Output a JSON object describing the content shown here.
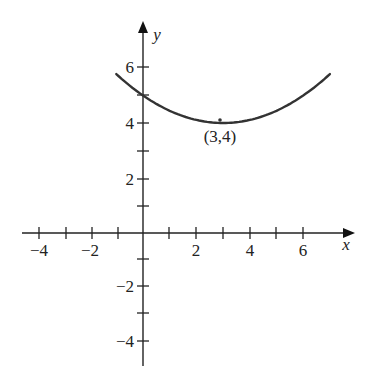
{
  "chart_data": {
    "type": "line",
    "title": "",
    "xlabel": "x",
    "ylabel": "y",
    "xlim": [
      -4.5,
      7.8
    ],
    "ylim": [
      -4.8,
      7.5
    ],
    "grid": false,
    "legend": null,
    "x_ticks": [
      -4,
      -3,
      -2,
      -1,
      1,
      2,
      3,
      4,
      5,
      6
    ],
    "x_tick_labels": [
      {
        "value": -4,
        "label": "−4"
      },
      {
        "value": -2,
        "label": "−2"
      },
      {
        "value": 2,
        "label": "2"
      },
      {
        "value": 4,
        "label": "4"
      },
      {
        "value": 6,
        "label": "6"
      }
    ],
    "y_ticks": [
      -4,
      -3,
      -2,
      -1,
      1,
      2,
      3,
      4,
      5,
      6
    ],
    "y_tick_labels": [
      {
        "value": 6,
        "label": "6"
      },
      {
        "value": 4,
        "label": "4"
      },
      {
        "value": 2,
        "label": "2"
      },
      {
        "value": -2,
        "label": "−2"
      },
      {
        "value": -4,
        "label": "−4"
      }
    ],
    "series": [
      {
        "name": "parabola",
        "description": "upward-opening parabola with vertex (3,4), y-intercept 5",
        "x": [
          -1,
          0,
          1,
          2,
          3,
          4,
          5,
          6,
          7
        ],
        "y": [
          5.78,
          5.0,
          4.44,
          4.11,
          4.0,
          4.11,
          4.44,
          5.0,
          5.78
        ]
      }
    ],
    "annotations": [
      {
        "text": "(3,4)",
        "x": 3,
        "y": 4,
        "position": "below"
      }
    ]
  },
  "labels": {
    "x_axis": "x",
    "y_axis": "y",
    "vertex": "(3,4)",
    "xt_m4": "−4",
    "xt_m2": "−2",
    "xt_2": "2",
    "xt_4": "4",
    "xt_6": "6",
    "yt_6": "6",
    "yt_4": "4",
    "yt_2": "2",
    "yt_m2": "−2",
    "yt_m4": "−4"
  }
}
